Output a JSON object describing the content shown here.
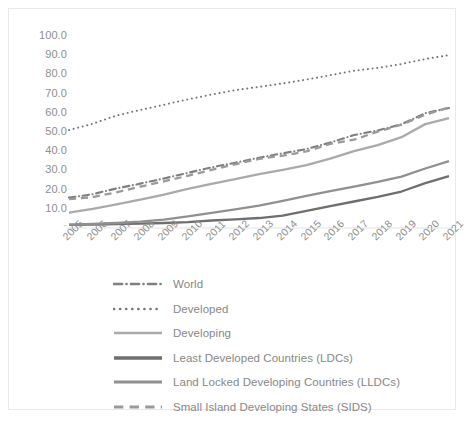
{
  "chart_data": {
    "type": "line",
    "title": "",
    "xlabel": "",
    "ylabel": "",
    "categories": [
      "2005",
      "2006",
      "2007",
      "2008",
      "2009",
      "2010",
      "2011",
      "2012",
      "2013",
      "2014",
      "2015",
      "2016",
      "2017",
      "2018",
      "2019",
      "2020",
      "2021"
    ],
    "x": [
      2005,
      2006,
      2007,
      2008,
      2009,
      2010,
      2011,
      2012,
      2013,
      2014,
      2015,
      2016,
      2017,
      2018,
      2019,
      2020,
      2021
    ],
    "ylim": [
      0,
      100
    ],
    "ytick_labels": [
      "-",
      "10.0",
      "20.0",
      "30.0",
      "40.0",
      "50.0",
      "60.0",
      "70.0",
      "80.0",
      "90.0",
      "100.0"
    ],
    "ytick_values": [
      0,
      10,
      20,
      30,
      40,
      50,
      60,
      70,
      80,
      90,
      100
    ],
    "grid": false,
    "legend_position": "bottom",
    "series": [
      {
        "name": "World",
        "style": "dash-dot",
        "color": "#7f7f7f",
        "values": [
          15.8,
          17.6,
          20.6,
          23.1,
          25.8,
          28.7,
          31.6,
          34.0,
          36.6,
          38.9,
          41.1,
          44.5,
          48.4,
          50.8,
          54.0,
          59.8,
          62.5
        ]
      },
      {
        "name": "Developed",
        "style": "dotted",
        "color": "#767676",
        "values": [
          51.0,
          54.3,
          58.6,
          61.5,
          64.2,
          67.0,
          69.5,
          71.8,
          73.5,
          75.3,
          77.3,
          79.6,
          81.9,
          83.4,
          85.4,
          88.0,
          90.0
        ]
      },
      {
        "name": "Developing",
        "style": "solid",
        "color": "#aaaaaa",
        "values": [
          8.0,
          10.0,
          12.3,
          14.8,
          17.4,
          20.4,
          23.0,
          25.5,
          28.0,
          30.3,
          32.7,
          36.1,
          40.0,
          43.2,
          47.3,
          54.1,
          57.2
        ]
      },
      {
        "name": "Least Developed Countries (LDCs)",
        "style": "solid",
        "color": "#6e6e6e",
        "values": [
          1.6,
          1.8,
          2.0,
          2.3,
          2.6,
          3.1,
          3.9,
          4.5,
          5.2,
          6.5,
          8.9,
          11.4,
          13.8,
          16.2,
          19.0,
          23.4,
          27.0
        ]
      },
      {
        "name": "Land Locked Developing Countries (LLDCs)",
        "style": "solid",
        "color": "#909090",
        "values": [
          1.8,
          2.1,
          2.6,
          3.3,
          4.4,
          6.0,
          7.9,
          9.7,
          11.7,
          14.1,
          16.7,
          19.2,
          21.5,
          24.0,
          26.8,
          31.0,
          34.8
        ]
      },
      {
        "name": "Small Island Developing States (SIDS)",
        "style": "dashed",
        "color": "#9a9a9a",
        "values": [
          15.0,
          16.1,
          18.6,
          21.5,
          24.3,
          27.2,
          30.3,
          33.2,
          36.0,
          37.7,
          39.9,
          43.8,
          46.0,
          50.2,
          53.8,
          59.0,
          62.8
        ]
      }
    ]
  },
  "axis": {
    "y_labels": [
      "100.0",
      "90.0",
      "80.0",
      "70.0",
      "60.0",
      "50.0",
      "40.0",
      "30.0",
      "20.0",
      "10.0",
      "-"
    ],
    "x_labels": [
      "2005",
      "2006",
      "2007",
      "2008",
      "2009",
      "2010",
      "2011",
      "2012",
      "2013",
      "2014",
      "2015",
      "2016",
      "2017",
      "2018",
      "2019",
      "2020",
      "2021"
    ]
  },
  "legend": {
    "items": [
      {
        "label": "World"
      },
      {
        "label": "Developed"
      },
      {
        "label": "Developing"
      },
      {
        "label": "Least Developed Countries (LDCs)"
      },
      {
        "label": "Land Locked Developing Countries (LLDCs)"
      },
      {
        "label": "Small Island Developing States (SIDS)"
      }
    ]
  }
}
